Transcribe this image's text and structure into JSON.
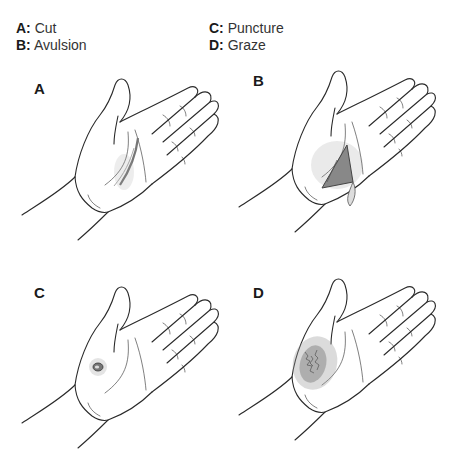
{
  "legend": {
    "items": [
      {
        "key": "A:",
        "label": "Cut"
      },
      {
        "key": "B:",
        "label": "Avulsion"
      },
      {
        "key": "C:",
        "label": "Puncture"
      },
      {
        "key": "D:",
        "label": "Graze"
      }
    ]
  },
  "panels": [
    {
      "letter": "A",
      "wound": "cut"
    },
    {
      "letter": "B",
      "wound": "avulsion"
    },
    {
      "letter": "C",
      "wound": "puncture"
    },
    {
      "letter": "D",
      "wound": "graze"
    }
  ],
  "colors": {
    "line": "#2a2a2a",
    "wound": "#8a8a8a",
    "background": "#ffffff"
  }
}
